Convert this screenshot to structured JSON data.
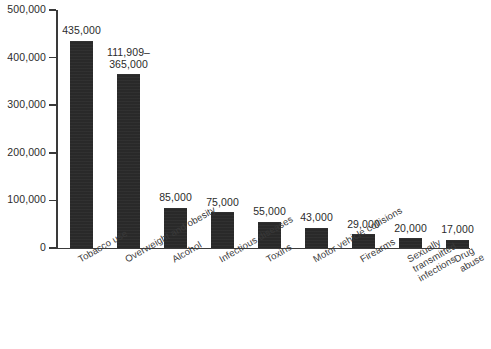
{
  "chart_data": {
    "type": "bar",
    "title": "",
    "subtitle": "",
    "xlabel": "",
    "ylabel": "",
    "ylim": [
      0,
      500000
    ],
    "ytick_interval": 100000,
    "grid": false,
    "legend": null,
    "orientation": "vertical",
    "bar_color": "#292929",
    "axis_color": "#3a3a3a",
    "background_color": "#ffffff",
    "ytick_labels": [
      "500,000",
      "400,000",
      "300,000",
      "200,000",
      "100,000",
      "0"
    ],
    "ytick_values": [
      500000,
      400000,
      300000,
      200000,
      100000,
      0
    ],
    "categories": [
      "Tobacco use",
      "Overweight and obesity",
      "Alcohol",
      "Infectious diseases",
      "Toxins",
      "Motor vehicle collisions",
      "Firearms",
      "Sexually transmitted\ninfections",
      "Drug abuse"
    ],
    "values": [
      435000,
      365000,
      85000,
      75000,
      55000,
      43000,
      29000,
      20000,
      17000
    ],
    "value_labels": [
      "435,000",
      "111,909–\n365,000",
      "85,000",
      "75,000",
      "55,000",
      "43,000",
      "29,000",
      "20,000",
      "17,000"
    ],
    "series": [
      {
        "name": "Annual deaths",
        "values": [
          435000,
          365000,
          85000,
          75000,
          55000,
          43000,
          29000,
          20000,
          17000
        ]
      }
    ]
  }
}
